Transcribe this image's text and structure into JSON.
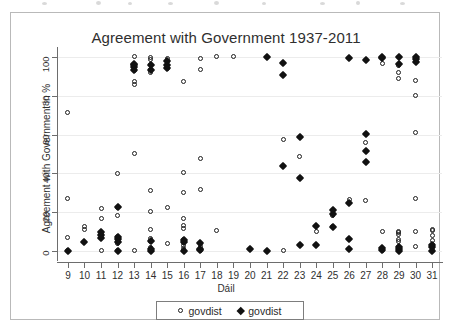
{
  "chart_data": {
    "type": "scatter",
    "title": "Agreement with Government 1937-2011",
    "xlabel": "Dáil",
    "ylabel": "Agreement with Government in %",
    "xlim": [
      8.4,
      31.6
    ],
    "ylim": [
      -4,
      104
    ],
    "grid": true,
    "x_ticks": [
      9,
      10,
      11,
      12,
      13,
      14,
      15,
      16,
      17,
      18,
      19,
      20,
      21,
      22,
      23,
      24,
      25,
      26,
      27,
      28,
      29,
      30,
      31
    ],
    "y_ticks": [
      0,
      20,
      40,
      60,
      80,
      100
    ],
    "legend_position": "bottom",
    "series": [
      {
        "name": "govdist",
        "marker": "open-circle",
        "color": "#1d1d1d",
        "points": [
          [
            9,
            0.2
          ],
          [
            9,
            7.0
          ],
          [
            9,
            27.3
          ],
          [
            9,
            71.5
          ],
          [
            10,
            11.4
          ],
          [
            10,
            12.8
          ],
          [
            11,
            0.2
          ],
          [
            11,
            7.0
          ],
          [
            11,
            9.6
          ],
          [
            11,
            16.6
          ],
          [
            11,
            22.2
          ],
          [
            12,
            0.2
          ],
          [
            12,
            4.0
          ],
          [
            12,
            5.6
          ],
          [
            12,
            7.6
          ],
          [
            12,
            18.2
          ],
          [
            12,
            22.6
          ],
          [
            12,
            40.2
          ],
          [
            13,
            0.2
          ],
          [
            13,
            50.3
          ],
          [
            13,
            85.6
          ],
          [
            13,
            87.4
          ],
          [
            13,
            93.2
          ],
          [
            13,
            95.6
          ],
          [
            13,
            100.0
          ],
          [
            14,
            0.4
          ],
          [
            14,
            2.0
          ],
          [
            14,
            5.2
          ],
          [
            14,
            6.4
          ],
          [
            14,
            11.2
          ],
          [
            14,
            20.5
          ],
          [
            14,
            31.2
          ],
          [
            14,
            91.8
          ],
          [
            14,
            93.7
          ],
          [
            14,
            96.2
          ],
          [
            14,
            98.5
          ],
          [
            14,
            99.6
          ],
          [
            15,
            3.8
          ],
          [
            15,
            22.7
          ],
          [
            15,
            94.0
          ],
          [
            15,
            97.5
          ],
          [
            15,
            99.2
          ],
          [
            16,
            0.2
          ],
          [
            16,
            1.6
          ],
          [
            16,
            3.0
          ],
          [
            16,
            4.6
          ],
          [
            16,
            5.8
          ],
          [
            16,
            11.8
          ],
          [
            16,
            13.2
          ],
          [
            16,
            16.8
          ],
          [
            16,
            30.1
          ],
          [
            16,
            40.4
          ],
          [
            16,
            87.3
          ],
          [
            17,
            0.6
          ],
          [
            17,
            2.2
          ],
          [
            17,
            4.0
          ],
          [
            17,
            31.5
          ],
          [
            17,
            47.8
          ],
          [
            17,
            93.5
          ],
          [
            17,
            99.0
          ],
          [
            18,
            10.5
          ],
          [
            18,
            100.0
          ],
          [
            19,
            100.0
          ],
          [
            22,
            0.2
          ],
          [
            22,
            57.3
          ],
          [
            23,
            48.6
          ],
          [
            24,
            10.1
          ],
          [
            25,
            12.6
          ],
          [
            25,
            18.4
          ],
          [
            26,
            26.8
          ],
          [
            27,
            26.2
          ],
          [
            27,
            55.8
          ],
          [
            28,
            0.6
          ],
          [
            28,
            10.2
          ],
          [
            28,
            96.6
          ],
          [
            29,
            0.4
          ],
          [
            29,
            1.4
          ],
          [
            29,
            2.6
          ],
          [
            29,
            5.0
          ],
          [
            29,
            6.2
          ],
          [
            29,
            8.6
          ],
          [
            29,
            9.6
          ],
          [
            29,
            10.4
          ],
          [
            29,
            88.8
          ],
          [
            29,
            91.8
          ],
          [
            29,
            95.3
          ],
          [
            30,
            2.6
          ],
          [
            30,
            10.4
          ],
          [
            30,
            27.2
          ],
          [
            30,
            61.2
          ],
          [
            30,
            80.1
          ],
          [
            30,
            87.8
          ],
          [
            31,
            0.4
          ],
          [
            31,
            2.0
          ],
          [
            31,
            3.4
          ],
          [
            31,
            5.4
          ],
          [
            31,
            8.0
          ],
          [
            31,
            10.5
          ],
          [
            31,
            11.2
          ]
        ]
      },
      {
        "name": "govdist",
        "marker": "filled-diamond",
        "color": "#111111",
        "points": [
          [
            9,
            0.0
          ],
          [
            10,
            5.0
          ],
          [
            11,
            6.6
          ],
          [
            11,
            8.4
          ],
          [
            11,
            9.8
          ],
          [
            12,
            0.0
          ],
          [
            12,
            5.0
          ],
          [
            12,
            6.4
          ],
          [
            12,
            7.4
          ],
          [
            12,
            22.6
          ],
          [
            13,
            93.4
          ],
          [
            13,
            94.6
          ],
          [
            13,
            95.6
          ],
          [
            13,
            96.4
          ],
          [
            14,
            0.2
          ],
          [
            14,
            1.2
          ],
          [
            14,
            5.4
          ],
          [
            14,
            93.4
          ],
          [
            14,
            95.6
          ],
          [
            15,
            94.0
          ],
          [
            15,
            95.6
          ],
          [
            15,
            97.8
          ],
          [
            16,
            0.2
          ],
          [
            16,
            5.0
          ],
          [
            16,
            5.8
          ],
          [
            17,
            0.4
          ],
          [
            17,
            1.4
          ],
          [
            17,
            4.2
          ],
          [
            20,
            1.0
          ],
          [
            21,
            0.2
          ],
          [
            21,
            100.0
          ],
          [
            22,
            43.8
          ],
          [
            22,
            90.6
          ],
          [
            22,
            96.8
          ],
          [
            23,
            3.2
          ],
          [
            23,
            37.8
          ],
          [
            23,
            58.6
          ],
          [
            24,
            3.0
          ],
          [
            24,
            13.0
          ],
          [
            25,
            12.6
          ],
          [
            25,
            19.2
          ],
          [
            25,
            21.2
          ],
          [
            26,
            1.4
          ],
          [
            26,
            6.4
          ],
          [
            26,
            25.0
          ],
          [
            26,
            99.4
          ],
          [
            27,
            46.0
          ],
          [
            27,
            51.6
          ],
          [
            27,
            60.2
          ],
          [
            27,
            98.2
          ],
          [
            28,
            0.4
          ],
          [
            28,
            1.6
          ],
          [
            28,
            99.6
          ],
          [
            28,
            100.0
          ],
          [
            29,
            0.2
          ],
          [
            29,
            1.0
          ],
          [
            29,
            2.0
          ],
          [
            29,
            96.4
          ],
          [
            29,
            99.8
          ],
          [
            30,
            97.4
          ],
          [
            30,
            99.0
          ],
          [
            30,
            100.0
          ],
          [
            31,
            0.2
          ],
          [
            31,
            2.0
          ],
          [
            31,
            3.4
          ]
        ]
      }
    ],
    "legend": [
      {
        "label": "govdist",
        "marker": "open-circle"
      },
      {
        "label": "govdist",
        "marker": "filled-diamond"
      }
    ]
  }
}
